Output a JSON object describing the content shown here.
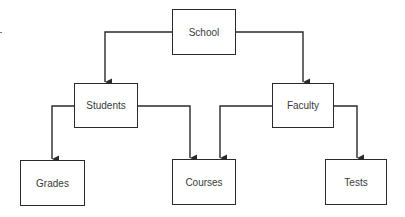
{
  "diagram": {
    "type": "hierarchy",
    "line_color": "#2a2a2a",
    "nodes": [
      {
        "id": "school",
        "label": "School"
      },
      {
        "id": "students",
        "label": "Students"
      },
      {
        "id": "faculty",
        "label": "Faculty"
      },
      {
        "id": "grades",
        "label": "Grades"
      },
      {
        "id": "courses",
        "label": "Courses"
      },
      {
        "id": "tests",
        "label": "Tests"
      }
    ],
    "edges": [
      {
        "from": "School",
        "to": "Students"
      },
      {
        "from": "School",
        "to": "Faculty"
      },
      {
        "from": "Students",
        "to": "Grades"
      },
      {
        "from": "Students",
        "to": "Courses"
      },
      {
        "from": "Faculty",
        "to": "Courses"
      },
      {
        "from": "Faculty",
        "to": "Tests"
      }
    ]
  }
}
